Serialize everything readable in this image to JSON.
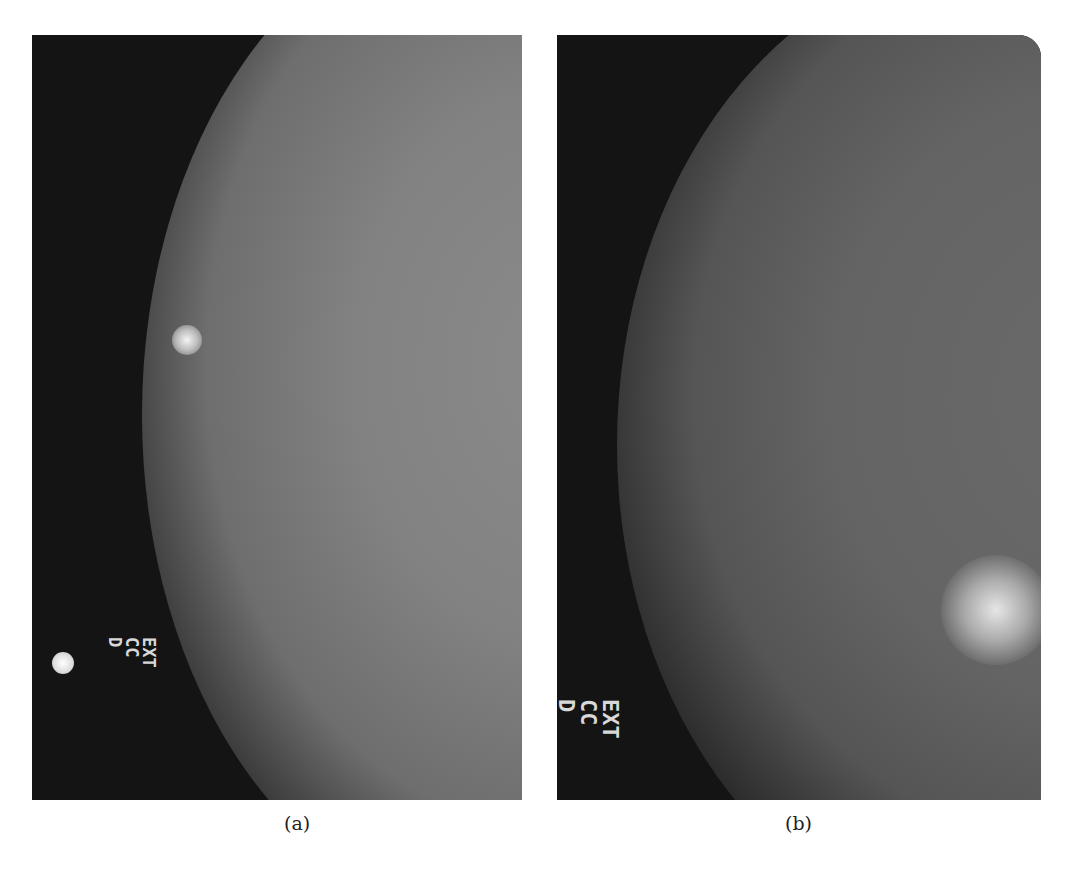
{
  "figure": {
    "panels": [
      {
        "id": "a",
        "caption": "(a)",
        "description": "Mammogram, craniocaudal view, left breast",
        "marker_text": "EXT\nCC\nD"
      },
      {
        "id": "b",
        "caption": "(b)",
        "description": "Mammogram, craniocaudal view, dense region on right",
        "marker_text": "EXT\nCC\nD"
      }
    ]
  }
}
